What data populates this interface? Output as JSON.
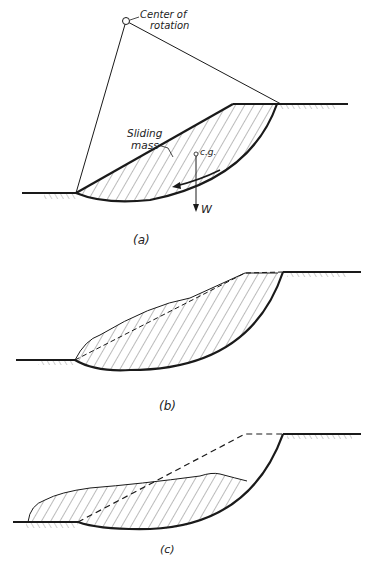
{
  "figure": {
    "panels": [
      {
        "id": "a",
        "caption": "(a)",
        "labels": {
          "center": "Center of",
          "center2": "rotation",
          "sliding": "Sliding",
          "mass": "mass",
          "cg": "c.g.",
          "weight": "W"
        }
      },
      {
        "id": "b",
        "caption": "(b)"
      },
      {
        "id": "c",
        "caption": "(c)"
      }
    ],
    "colors": {
      "line": "#1a1a1a",
      "hatch": "#444444",
      "background": "#ffffff"
    }
  }
}
